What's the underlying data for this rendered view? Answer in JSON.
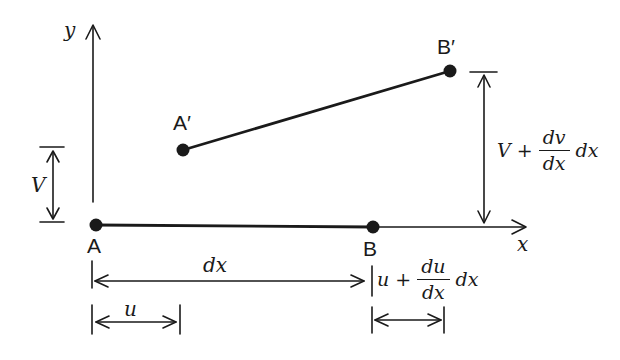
{
  "figure": {
    "colors": {
      "ink": "#1a1a1a",
      "background": "#ffffff"
    },
    "axes": {
      "x_label": "x",
      "y_label": "y"
    },
    "points": {
      "A": "A",
      "B": "B",
      "A_prime": "A′",
      "B_prime": "B′"
    },
    "dimensions": {
      "v_label": "V",
      "dx_label": "dx",
      "u_label": "u",
      "v_plus": {
        "prefix": "V +",
        "numerator": "dv",
        "denominator": "dx",
        "suffix": "dx"
      },
      "u_plus": {
        "prefix": "u +",
        "numerator": "du",
        "denominator": "dx",
        "suffix": "dx"
      }
    }
  }
}
